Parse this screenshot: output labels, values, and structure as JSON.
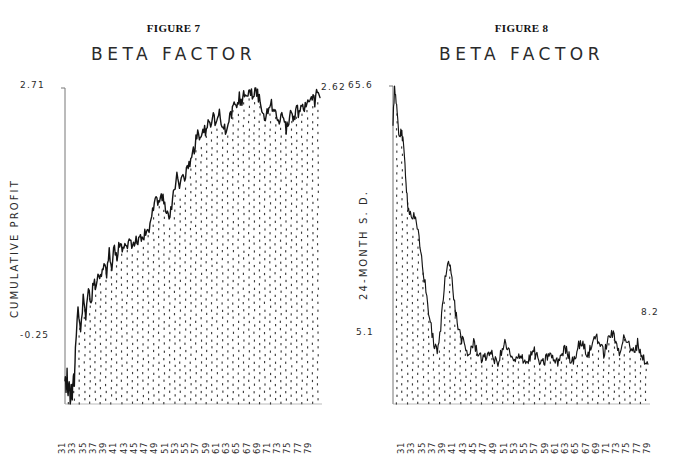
{
  "page": {
    "background": "#ffffff",
    "ink": "#1a1a1a"
  },
  "figures": [
    {
      "heading": "FIGURE 7",
      "title": "BETA FACTOR",
      "ylabel": "CUMULATIVE PROFIT",
      "ymax_label": "2.71",
      "ymin_label": "-0.25",
      "yend_label": "2.62"
    },
    {
      "heading": "FIGURE 8",
      "title": "BETA FACTOR",
      "ylabel": "24-MONTH S. D.",
      "ymax_label": "65.6",
      "ymin_label": "5.1",
      "yend_label": "8.2"
    }
  ],
  "xticks": [
    "31",
    "33",
    "35",
    "37",
    "39",
    "41",
    "43",
    "45",
    "47",
    "49",
    "51",
    "53",
    "55",
    "57",
    "59",
    "61",
    "63",
    "65",
    "67",
    "69",
    "71",
    "73",
    "75",
    "77",
    "79"
  ],
  "chart_data": [
    {
      "type": "area",
      "title": "BETA FACTOR",
      "subtitle": "FIGURE 7",
      "xlabel": "",
      "ylabel": "CUMULATIVE PROFIT",
      "ylim": [
        -0.25,
        2.71
      ],
      "xlim": [
        31,
        80
      ],
      "grid": false,
      "legend": null,
      "fill": "dotted-stipple",
      "annotations": [
        {
          "text": "2.71",
          "position": "y-axis-top"
        },
        {
          "text": "-0.25",
          "position": "y-axis-bottom"
        },
        {
          "text": "2.62",
          "position": "series-end-right"
        }
      ],
      "tick_labels": [
        "31",
        "33",
        "35",
        "37",
        "39",
        "41",
        "43",
        "45",
        "47",
        "49",
        "51",
        "53",
        "55",
        "57",
        "59",
        "61",
        "63",
        "65",
        "67",
        "69",
        "71",
        "73",
        "75",
        "77",
        "79"
      ],
      "x": [
        31.0,
        31.2,
        31.4,
        31.6,
        31.8,
        32.0,
        32.2,
        32.4,
        32.6,
        32.8,
        33.0,
        33.5,
        34.0,
        34.5,
        35.0,
        35.5,
        36.0,
        36.5,
        37.0,
        37.5,
        38.0,
        38.5,
        39.0,
        39.5,
        40.0,
        40.5,
        41.0,
        41.5,
        42.0,
        42.5,
        43.0,
        43.5,
        44.0,
        44.5,
        45.0,
        45.5,
        46.0,
        46.5,
        47.0,
        47.5,
        48.0,
        48.5,
        49.0,
        49.5,
        50.0,
        50.5,
        51.0,
        51.5,
        52.0,
        52.5,
        53.0,
        53.5,
        54.0,
        54.5,
        55.0,
        55.5,
        56.0,
        56.5,
        57.0,
        57.5,
        58.0,
        58.5,
        59.0,
        59.5,
        60.0,
        60.5,
        61.0,
        61.5,
        62.0,
        62.5,
        63.0,
        63.5,
        64.0,
        64.5,
        65.0,
        65.5,
        66.0,
        66.5,
        67.0,
        67.5,
        68.0,
        68.5,
        69.0,
        69.5,
        70.0,
        70.5,
        71.0,
        71.5,
        72.0,
        72.5,
        73.0,
        73.5,
        74.0,
        74.5,
        75.0,
        75.5,
        76.0,
        76.5,
        77.0,
        77.5,
        78.0,
        78.5,
        79.0,
        79.5,
        80.0
      ],
      "y": [
        0.02,
        -0.12,
        0.05,
        -0.2,
        0.0,
        -0.25,
        -0.08,
        -0.18,
        0.02,
        -0.1,
        0.3,
        0.62,
        0.46,
        0.74,
        0.58,
        0.8,
        0.7,
        0.9,
        0.82,
        0.98,
        0.92,
        1.06,
        0.98,
        1.16,
        1.05,
        1.22,
        1.12,
        1.26,
        1.18,
        1.3,
        1.24,
        1.28,
        1.22,
        1.3,
        1.26,
        1.34,
        1.3,
        1.38,
        1.34,
        1.44,
        1.58,
        1.72,
        1.6,
        1.74,
        1.64,
        1.56,
        1.5,
        1.62,
        1.78,
        1.88,
        1.82,
        1.94,
        1.88,
        2.0,
        1.96,
        2.08,
        2.18,
        2.3,
        2.24,
        2.36,
        2.28,
        2.4,
        2.34,
        2.44,
        2.36,
        2.48,
        2.42,
        2.34,
        2.28,
        2.4,
        2.46,
        2.56,
        2.5,
        2.62,
        2.56,
        2.68,
        2.62,
        2.7,
        2.64,
        2.71,
        2.66,
        2.58,
        2.5,
        2.42,
        2.5,
        2.6,
        2.52,
        2.44,
        2.36,
        2.46,
        2.4,
        2.32,
        2.4,
        2.48,
        2.42,
        2.52,
        2.46,
        2.56,
        2.5,
        2.6,
        2.54,
        2.64,
        2.58,
        2.68,
        2.62
      ]
    },
    {
      "type": "area",
      "title": "BETA FACTOR",
      "subtitle": "FIGURE 8",
      "xlabel": "",
      "ylabel": "24-MONTH S. D.",
      "ylim": [
        0.0,
        65.6
      ],
      "xlim": [
        31,
        80
      ],
      "grid": false,
      "legend": null,
      "fill": "dotted-stipple",
      "annotations": [
        {
          "text": "65.6",
          "position": "y-axis-top"
        },
        {
          "text": "5.1",
          "position": "y-axis-lower"
        },
        {
          "text": "8.2",
          "position": "series-end-right"
        }
      ],
      "tick_labels": [
        "31",
        "33",
        "35",
        "37",
        "39",
        "41",
        "43",
        "45",
        "47",
        "49",
        "51",
        "53",
        "55",
        "57",
        "59",
        "61",
        "63",
        "65",
        "67",
        "69",
        "71",
        "73",
        "75",
        "77",
        "79"
      ],
      "x": [
        31.0,
        31.3,
        31.6,
        31.9,
        32.2,
        32.5,
        32.8,
        33.1,
        33.4,
        33.7,
        34.0,
        34.5,
        35.0,
        35.5,
        36.0,
        36.5,
        37.0,
        37.5,
        38.0,
        38.5,
        39.0,
        39.5,
        40.0,
        40.5,
        41.0,
        41.5,
        42.0,
        42.5,
        43.0,
        43.5,
        44.0,
        44.5,
        45.0,
        45.5,
        46.0,
        46.5,
        47.0,
        47.5,
        48.0,
        48.5,
        49.0,
        49.5,
        50.0,
        50.5,
        51.0,
        51.5,
        52.0,
        52.5,
        53.0,
        53.5,
        54.0,
        54.5,
        55.0,
        55.5,
        56.0,
        56.5,
        57.0,
        57.5,
        58.0,
        58.5,
        59.0,
        59.5,
        60.0,
        60.5,
        61.0,
        61.5,
        62.0,
        62.5,
        63.0,
        63.5,
        64.0,
        64.5,
        65.0,
        65.5,
        66.0,
        66.5,
        67.0,
        67.5,
        68.0,
        68.5,
        69.0,
        69.5,
        70.0,
        70.5,
        71.0,
        71.5,
        72.0,
        72.5,
        73.0,
        73.5,
        74.0,
        74.5,
        75.0,
        75.5,
        76.0,
        76.5,
        77.0,
        77.5,
        78.0,
        78.5,
        79.0,
        79.5,
        80.0
      ],
      "y": [
        58.0,
        65.6,
        62.0,
        58.0,
        55.5,
        56.5,
        55.0,
        52.0,
        48.0,
        43.0,
        40.0,
        39.0,
        38.5,
        37.0,
        34.0,
        30.0,
        26.0,
        22.0,
        18.0,
        14.5,
        12.0,
        10.5,
        14.0,
        20.0,
        26.0,
        30.0,
        28.0,
        24.0,
        19.0,
        16.0,
        14.0,
        12.5,
        11.0,
        10.0,
        11.5,
        12.5,
        11.5,
        10.5,
        9.5,
        9.0,
        10.0,
        11.0,
        10.0,
        9.0,
        8.5,
        9.5,
        11.0,
        12.5,
        11.5,
        10.0,
        9.0,
        8.5,
        9.5,
        10.5,
        9.5,
        8.5,
        9.0,
        10.0,
        11.0,
        10.0,
        9.0,
        8.0,
        8.5,
        9.5,
        10.5,
        9.5,
        9.0,
        8.5,
        9.5,
        10.5,
        11.5,
        10.5,
        9.5,
        9.0,
        10.0,
        11.5,
        13.0,
        12.0,
        11.0,
        10.0,
        11.5,
        13.0,
        14.5,
        13.0,
        11.5,
        10.5,
        12.0,
        13.5,
        15.0,
        13.5,
        12.0,
        11.0,
        12.5,
        14.0,
        13.0,
        11.5,
        10.5,
        11.5,
        12.5,
        11.0,
        9.5,
        8.8,
        8.2
      ]
    }
  ]
}
